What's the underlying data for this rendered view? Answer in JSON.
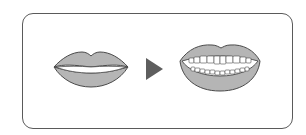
{
  "diagram": {
    "steps": [
      {
        "id": "closed-lips",
        "label": ""
      },
      {
        "id": "open-smile",
        "label": ""
      }
    ],
    "arrow": {
      "direction": "right"
    }
  },
  "colors": {
    "lip_fill": "#b5b5b5",
    "outline": "#4a4a4a",
    "arrow": "#5e5e5e",
    "frame_border": "#5a5a5a",
    "teeth": "#ffffff",
    "background": "#ffffff"
  }
}
